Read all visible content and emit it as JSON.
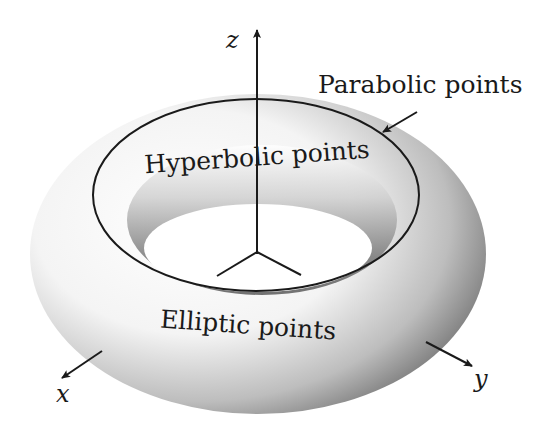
{
  "figure": {
    "labels": {
      "parabolic": "Parabolic points",
      "hyperbolic": "Hyperbolic points",
      "elliptic": "Elliptic points"
    },
    "axes": {
      "x": "x",
      "y": "y",
      "z": "z"
    },
    "colors": {
      "background": "#ffffff",
      "line": "#1a1a1a",
      "shade_dark": "#5a5a5a",
      "shade_light": "#ffffff"
    }
  }
}
